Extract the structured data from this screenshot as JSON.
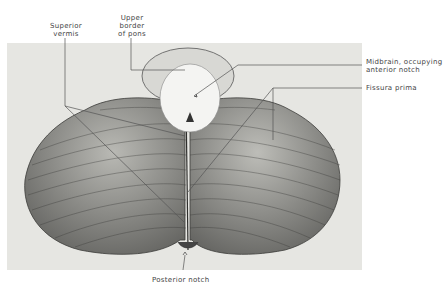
{
  "figure": {
    "labels": {
      "superior_vermis": [
        "Superior",
        "vermis"
      ],
      "upper_border_of_pons": [
        "Upper",
        "border",
        "of pons"
      ],
      "midbrain": [
        "Midbrain, occupying",
        "anterior notch"
      ],
      "fissura_prima": "Fissura prima",
      "posterior_notch": "Posterior notch"
    },
    "colors": {
      "panel": "#e6e6e2",
      "tissue_light": "#c9c9c4",
      "tissue_dark": "#4a4a48",
      "midbrain": "#f4f4f2",
      "leader_line": "#555555"
    }
  }
}
